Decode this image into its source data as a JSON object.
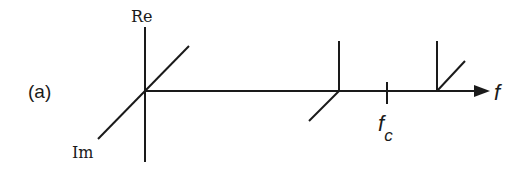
{
  "diagram": {
    "panel_label": "(a)",
    "axes": {
      "real_label": "Re",
      "imag_label": "Im",
      "freq_label": "f",
      "carrier_label_main": "f",
      "carrier_label_sub": "c"
    },
    "components": [
      {
        "name": "dc-component",
        "position": "origin",
        "direction": "imaginary-positive"
      },
      {
        "name": "lower-sideband",
        "position": "f_c - f_m",
        "direction": "real-positive and imaginary-negative"
      },
      {
        "name": "upper-sideband",
        "position": "f_c + f_m",
        "direction": "real-positive and imaginary-positive"
      }
    ],
    "colors": {
      "line": "#1a1a1a",
      "background": "#ffffff"
    }
  }
}
